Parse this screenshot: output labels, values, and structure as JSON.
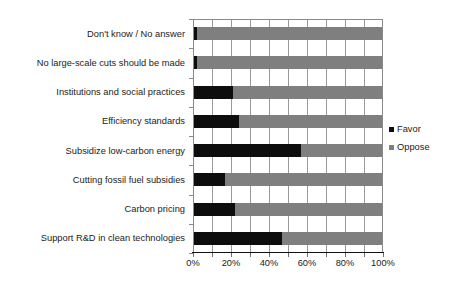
{
  "chart_data": {
    "type": "bar",
    "orientation": "horizontal",
    "stacked": true,
    "title": "",
    "subtitle": "",
    "xlabel": "",
    "ylabel": "",
    "xlim": [
      0,
      100
    ],
    "xticks": [
      0,
      10,
      20,
      30,
      40,
      50,
      60,
      70,
      80,
      90,
      100
    ],
    "xtick_labels": [
      "0%",
      "",
      "20%",
      "",
      "40%",
      "",
      "60%",
      "",
      "80%",
      "",
      "100%"
    ],
    "grid": true,
    "grid_axis": "x",
    "legend_position": "right",
    "categories": [
      "Don't know / No answer",
      "No large-scale cuts should be made",
      "Institutions and social practices",
      "Efficiency standards",
      "Subsidize low-carbon energy",
      "Cutting fossil fuel subsidies",
      "Carbon pricing",
      "Support R&D in clean technologies"
    ],
    "series": [
      {
        "name": "Favor",
        "color": "#0d0d0d",
        "values": [
          2,
          2,
          21,
          24,
          57,
          17,
          22,
          47
        ]
      },
      {
        "name": "Oppose",
        "color": "#7f7f7f",
        "values": [
          98,
          98,
          79,
          76,
          43,
          83,
          78,
          53
        ]
      }
    ],
    "value_unit": "%"
  },
  "legend": {
    "items": [
      {
        "label": "Favor",
        "swatch": "favor-swatch"
      },
      {
        "label": "Oppose",
        "swatch": "oppose-swatch"
      }
    ]
  },
  "colors": {
    "favor": "#0d0d0d",
    "oppose": "#7f7f7f",
    "grid": "#9a9a9a",
    "axis": "#111111",
    "background": "#ffffff"
  }
}
